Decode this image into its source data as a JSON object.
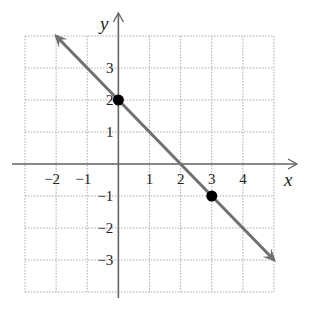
{
  "chart_data": {
    "type": "line",
    "title": "",
    "xlabel": "x",
    "ylabel": "y",
    "xlim": [
      -3,
      5
    ],
    "ylim": [
      -4,
      4
    ],
    "grid": true,
    "grid_style": "dotted",
    "x_ticks": [
      -2,
      -1,
      1,
      2,
      3,
      4
    ],
    "y_ticks": [
      3,
      2,
      1,
      -1,
      -2,
      -3
    ],
    "x_tick_labels": [
      "−2",
      "−1",
      "1",
      "2",
      "3",
      "4"
    ],
    "y_tick_labels": [
      "3",
      "2",
      "1",
      "−1",
      "−2",
      "−3"
    ],
    "series": [
      {
        "name": "line",
        "equation": "y = -x + 2",
        "x": [
          -2,
          5
        ],
        "y": [
          4,
          -3
        ],
        "arrows": "both",
        "color": "#707070"
      }
    ],
    "points": [
      {
        "x": 0,
        "y": 2
      },
      {
        "x": 3,
        "y": -1
      }
    ]
  },
  "colors": {
    "line": "#707070",
    "axis": "#666666",
    "grid": "#aaaaaa",
    "point": "#000000"
  }
}
